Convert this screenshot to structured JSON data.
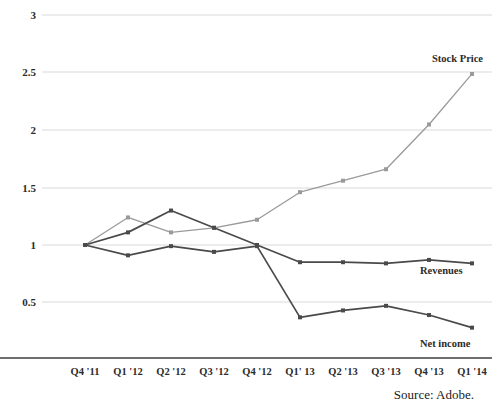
{
  "chart_data": {
    "type": "line",
    "title": "",
    "subtitle": "",
    "xlabel": "",
    "ylabel": "",
    "ylim": [
      0,
      3
    ],
    "yticks": [
      0.5,
      1,
      1.5,
      2,
      2.5,
      3
    ],
    "ytick_labels": [
      "0.5",
      "1",
      "1.5",
      "2",
      "2.5",
      "3"
    ],
    "grid": true,
    "legend_position": "inline-right",
    "categories": [
      "Q4 '11",
      "Q1 '12",
      "Q2 '12",
      "Q3 '12",
      "Q4 '12",
      "Q1' 13",
      "Q2 '13",
      "Q3 '13",
      "Q4 '13",
      "Q1 '14"
    ],
    "series": [
      {
        "name": "Stock Price",
        "color": "#9a9a9a",
        "values": [
          1.0,
          1.24,
          1.11,
          1.15,
          1.22,
          1.46,
          1.56,
          1.66,
          2.05,
          2.49
        ]
      },
      {
        "name": "Revenues",
        "color": "#4a4a4a",
        "values": [
          1.0,
          1.11,
          1.3,
          1.15,
          1.0,
          0.85,
          0.85,
          0.84,
          0.87,
          0.84
        ]
      },
      {
        "name": "Net income",
        "color": "#4a4a4a",
        "values": [
          1.0,
          0.91,
          0.99,
          0.94,
          0.99,
          0.37,
          0.43,
          0.47,
          0.39,
          0.28
        ]
      }
    ],
    "annotations": [
      {
        "name": "stock-price-label",
        "text": "Stock Price"
      },
      {
        "name": "revenues-label",
        "text": "Revenues"
      },
      {
        "name": "net-income-label",
        "text": "Net income"
      }
    ]
  },
  "footer": {
    "source": "Source: Adobe."
  },
  "axis": {
    "tick_0": "0.5",
    "tick_1": "1",
    "tick_2": "1.5",
    "tick_3": "2",
    "tick_4": "2.5",
    "tick_5": "3",
    "cat_0": "Q4 '11",
    "cat_1": "Q1 '12",
    "cat_2": "Q2 '12",
    "cat_3": "Q3 '12",
    "cat_4": "Q4 '12",
    "cat_5": "Q1' 13",
    "cat_6": "Q2 '13",
    "cat_7": "Q3 '13",
    "cat_8": "Q4 '13",
    "cat_9": "Q1 '14"
  },
  "labels": {
    "stock_price": "Stock Price",
    "revenues": "Revenues",
    "net_income": "Net income"
  }
}
